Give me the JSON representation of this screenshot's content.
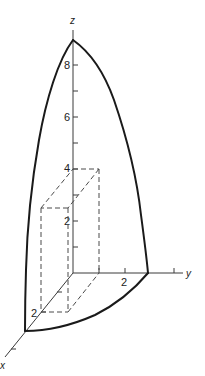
{
  "figure": {
    "axes": {
      "x_label": "x",
      "y_label": "y",
      "z_label": "z"
    },
    "tick_labels": {
      "z_2": "2",
      "z_4": "4",
      "z_6": "6",
      "z_8": "8",
      "y_2": "2",
      "x_2": "2"
    },
    "colors": {
      "curve": "#1a1a1a",
      "axis": "#3a3a3a",
      "dashed_box": "#4a4a4a",
      "background": "#ffffff"
    }
  }
}
